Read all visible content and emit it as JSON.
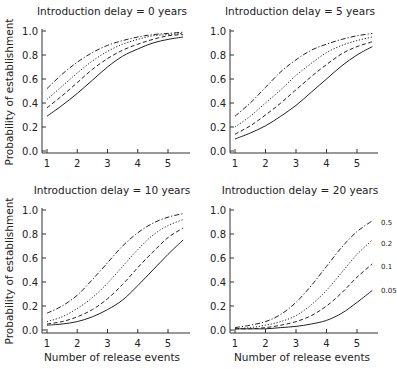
{
  "figure": {
    "ylabel": "Probability of establishment",
    "xlabel": "Number of release events",
    "legend_labels": [
      "0.5",
      "0.2",
      "0.1",
      "0.05"
    ]
  },
  "chart_data": [
    {
      "type": "line",
      "title": "Introduction delay = 0 years",
      "xlabel": "",
      "ylabel": "Probability of establishment",
      "xlim": [
        1,
        5.5
      ],
      "ylim": [
        0,
        1
      ],
      "xticks": [
        1,
        2,
        3,
        4,
        5
      ],
      "yticks": [
        "0.0",
        "0.2",
        "0.4",
        "0.6",
        "0.8",
        "1.0"
      ],
      "x": [
        1,
        1.5,
        2,
        2.5,
        3,
        3.5,
        4,
        4.5,
        5,
        5.5
      ],
      "series": [
        {
          "name": "0.5",
          "style": "dashdot",
          "values": [
            0.52,
            0.64,
            0.74,
            0.82,
            0.88,
            0.92,
            0.95,
            0.97,
            0.98,
            0.99
          ]
        },
        {
          "name": "0.2",
          "style": "dotted",
          "values": [
            0.43,
            0.54,
            0.65,
            0.75,
            0.83,
            0.89,
            0.93,
            0.96,
            0.97,
            0.98
          ]
        },
        {
          "name": "0.1",
          "style": "dashed",
          "values": [
            0.36,
            0.46,
            0.57,
            0.68,
            0.77,
            0.84,
            0.89,
            0.93,
            0.96,
            0.97
          ]
        },
        {
          "name": "0.05",
          "style": "solid",
          "values": [
            0.29,
            0.38,
            0.48,
            0.59,
            0.7,
            0.79,
            0.85,
            0.9,
            0.93,
            0.95
          ]
        }
      ]
    },
    {
      "type": "line",
      "title": "Introduction delay = 5 years",
      "xlabel": "",
      "ylabel": "",
      "xlim": [
        1,
        5.5
      ],
      "ylim": [
        0,
        1
      ],
      "xticks": [
        1,
        2,
        3,
        4,
        5
      ],
      "yticks": [
        "0.0",
        "0.2",
        "0.4",
        "0.6",
        "0.8",
        "1.0"
      ],
      "x": [
        1,
        1.5,
        2,
        2.5,
        3,
        3.5,
        4,
        4.5,
        5,
        5.5
      ],
      "series": [
        {
          "name": "0.5",
          "style": "dashdot",
          "values": [
            0.29,
            0.4,
            0.53,
            0.66,
            0.76,
            0.84,
            0.89,
            0.93,
            0.96,
            0.98
          ]
        },
        {
          "name": "0.2",
          "style": "dotted",
          "values": [
            0.2,
            0.29,
            0.4,
            0.51,
            0.63,
            0.73,
            0.82,
            0.88,
            0.92,
            0.95
          ]
        },
        {
          "name": "0.1",
          "style": "dashed",
          "values": [
            0.14,
            0.21,
            0.3,
            0.4,
            0.51,
            0.62,
            0.72,
            0.81,
            0.87,
            0.91
          ]
        },
        {
          "name": "0.05",
          "style": "solid",
          "values": [
            0.1,
            0.15,
            0.21,
            0.29,
            0.38,
            0.49,
            0.6,
            0.71,
            0.8,
            0.87
          ]
        }
      ]
    },
    {
      "type": "line",
      "title": "Introduction delay = 10 years",
      "xlabel": "Number of release events",
      "ylabel": "Probability of establishment",
      "xlim": [
        1,
        5.5
      ],
      "ylim": [
        0,
        1
      ],
      "xticks": [
        1,
        2,
        3,
        4,
        5
      ],
      "yticks": [
        "0.0",
        "0.2",
        "0.4",
        "0.6",
        "0.8",
        "1.0"
      ],
      "x": [
        1,
        1.5,
        2,
        2.5,
        3,
        3.5,
        4,
        4.5,
        5,
        5.5
      ],
      "series": [
        {
          "name": "0.5",
          "style": "dashdot",
          "values": [
            0.14,
            0.2,
            0.29,
            0.42,
            0.56,
            0.7,
            0.81,
            0.89,
            0.94,
            0.97
          ]
        },
        {
          "name": "0.2",
          "style": "dotted",
          "values": [
            0.07,
            0.11,
            0.18,
            0.27,
            0.39,
            0.53,
            0.67,
            0.79,
            0.87,
            0.92
          ]
        },
        {
          "name": "0.1",
          "style": "dashed",
          "values": [
            0.05,
            0.07,
            0.11,
            0.17,
            0.26,
            0.38,
            0.52,
            0.65,
            0.77,
            0.85
          ]
        },
        {
          "name": "0.05",
          "style": "solid",
          "values": [
            0.04,
            0.05,
            0.07,
            0.11,
            0.17,
            0.25,
            0.37,
            0.5,
            0.63,
            0.75
          ]
        }
      ]
    },
    {
      "type": "line",
      "title": "Introduction delay = 20 years",
      "xlabel": "Number of release events",
      "ylabel": "",
      "xlim": [
        1,
        5.5
      ],
      "ylim": [
        0,
        1
      ],
      "xticks": [
        1,
        2,
        3,
        4,
        5
      ],
      "yticks": [
        "0.0",
        "0.2",
        "0.4",
        "0.6",
        "0.8",
        "1.0"
      ],
      "x": [
        1,
        1.5,
        2,
        2.5,
        3,
        3.5,
        4,
        4.5,
        5,
        5.5
      ],
      "annotations": [
        "0.5",
        "0.2",
        "0.1",
        "0.05"
      ],
      "series": [
        {
          "name": "0.5",
          "style": "dashdot",
          "values": [
            0.02,
            0.04,
            0.07,
            0.13,
            0.23,
            0.37,
            0.53,
            0.69,
            0.82,
            0.91
          ]
        },
        {
          "name": "0.2",
          "style": "dotted",
          "values": [
            0.01,
            0.02,
            0.04,
            0.07,
            0.12,
            0.21,
            0.33,
            0.48,
            0.63,
            0.75
          ]
        },
        {
          "name": "0.1",
          "style": "dashed",
          "values": [
            0.01,
            0.01,
            0.02,
            0.04,
            0.07,
            0.12,
            0.2,
            0.31,
            0.44,
            0.55
          ]
        },
        {
          "name": "0.05",
          "style": "solid",
          "values": [
            0.01,
            0.01,
            0.01,
            0.02,
            0.03,
            0.05,
            0.08,
            0.14,
            0.23,
            0.33
          ]
        }
      ]
    }
  ]
}
